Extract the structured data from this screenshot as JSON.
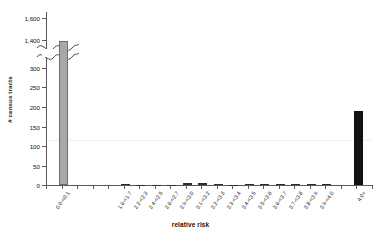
{
  "chart_data": {
    "type": "bar",
    "title": "",
    "xlabel": "relative risk",
    "ylabel": "# census tracts",
    "grid": false,
    "legend": "none",
    "axis_break": {
      "present": true,
      "lower_max": 300,
      "upper_min": 1400,
      "note": "y-axis broken between 300 and 1,400"
    },
    "ylim_lower": [
      0,
      300
    ],
    "ylim_upper": [
      1400,
      1600
    ],
    "ytick_labels_lower": [
      "0",
      "50",
      "100",
      "150",
      "200",
      "250",
      "300"
    ],
    "ytick_labels_upper": [
      "1,400",
      "1,600"
    ],
    "categories": [
      "0.0-<0.1",
      "1.6-<1.7",
      "2.2-<2.3",
      "2.4-<2.5",
      "2.6-<2.7",
      "2.9-<3.0",
      "3.1-<3.2",
      "3.2-<3.3",
      "3.3-<3.4",
      "3.4-<3.5",
      "3.5-<3.6",
      "3.6-<3.7",
      "3.7-<3.8",
      "3.8-<3.9",
      "3.9-<4.0",
      "4.0+"
    ],
    "values": [
      1395,
      2,
      1,
      1,
      1,
      4,
      5,
      2,
      1,
      2,
      3,
      3,
      3,
      3,
      2,
      190
    ],
    "bar_colors": [
      "#a8a8a8",
      "#2b2b2b",
      "#2b2b2b",
      "#2b2b2b",
      "#2b2b2b",
      "#2b2b2b",
      "#2b2b2b",
      "#2b2b2b",
      "#2b2b2b",
      "#2b2b2b",
      "#2b2b2b",
      "#2b2b2b",
      "#2b2b2b",
      "#2b2b2b",
      "#2b2b2b",
      "#111111"
    ],
    "accent_color": "#a8a8a8",
    "axis_color": "#5a5a5a",
    "text_color": "#111111"
  }
}
